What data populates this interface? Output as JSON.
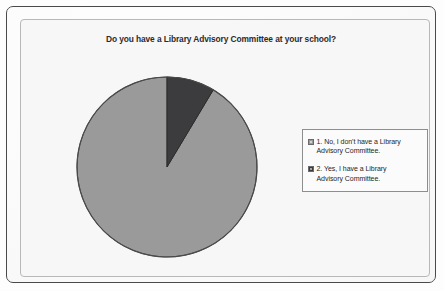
{
  "chart_data": {
    "type": "pie",
    "title": "Do you have a Library Advisory Committee at your school?",
    "subtitle": "",
    "xlabel": "",
    "ylabel": "",
    "legend_position": "right",
    "grid": false,
    "start_angle_deg": 90,
    "direction": "counterclockwise",
    "categories": [
      "1. No, I don't have a Library Advisory Committee.",
      "2. Yes, I have a Library Advisory Committee."
    ],
    "values": [
      91.4,
      8.6
    ],
    "value_unit": "percent",
    "slices": [
      {
        "index": 1,
        "label": "1. No, I don't have a Library Advisory Committee.",
        "short_label": "No",
        "value": 91.4,
        "sweep_deg": 329,
        "color": "#9a9a9a",
        "edge_color": "#4a4a4a"
      },
      {
        "index": 2,
        "label": "2. Yes, I have a Library Advisory Committee.",
        "short_label": "Yes",
        "value": 8.6,
        "sweep_deg": 31,
        "color": "#3c3c3e",
        "edge_color": "#2a2a2a"
      }
    ],
    "data_labels_shown": false
  },
  "legend": {
    "entries": [
      {
        "marker": "legend-swatch-icon",
        "line1": "1. No, I don't have a Library",
        "line2": "Advisory Committee.",
        "color": "#9a9a9a"
      },
      {
        "marker": "legend-swatch-icon",
        "line1": "2. Yes, I have a Library",
        "line2": "Advisory Committee.",
        "color": "#3c3c3e"
      }
    ]
  },
  "theme": {
    "page_background": "#fafafa",
    "plot_background": "#f7f7f7",
    "outer_border": "#4a4a4a",
    "plot_border": "#b8b8b8",
    "title_color": "#2b2b2b",
    "text_color": "#1f1f1f",
    "slice_light": "#9a9a9a",
    "slice_dark": "#3c3c3e"
  }
}
